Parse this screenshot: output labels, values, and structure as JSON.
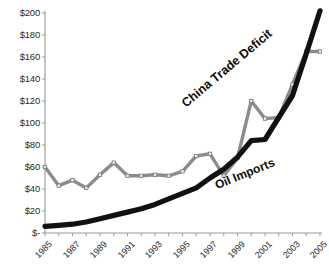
{
  "chart_data": {
    "type": "line",
    "title": "",
    "xlabel": "",
    "ylabel": "",
    "x": [
      1985,
      1986,
      1987,
      1988,
      1989,
      1990,
      1991,
      1992,
      1993,
      1994,
      1995,
      1996,
      1997,
      1998,
      1999,
      2000,
      2001,
      2002,
      2003,
      2004,
      2005
    ],
    "tick_labels": [
      "1985",
      "1987",
      "1989",
      "1991",
      "1993",
      "1995",
      "1997",
      "1999",
      "2001",
      "2003",
      "2005"
    ],
    "y_ticks": [
      "$-",
      "$20",
      "$40",
      "$60",
      "$80",
      "$100",
      "$120",
      "$140",
      "$160",
      "$180",
      "$200"
    ],
    "y_tick_values": [
      0,
      20,
      40,
      60,
      80,
      100,
      120,
      140,
      160,
      180,
      200
    ],
    "ylim": [
      0,
      200
    ],
    "xlim": [
      1985,
      2005
    ],
    "grid": false,
    "legend_position": "inline-rotated",
    "series": [
      {
        "name": "China Trade Deficit",
        "color": "#111111",
        "style": "thick-line-no-markers",
        "values": [
          6,
          7,
          8,
          10,
          13,
          16,
          19,
          22,
          26,
          31,
          36,
          41,
          50,
          58,
          69,
          84,
          85,
          105,
          125,
          163,
          202
        ]
      },
      {
        "name": "Oil Imports",
        "color": "#8c8c8c",
        "style": "line-with-square-markers",
        "values": [
          60,
          43,
          48,
          41,
          53,
          64,
          52,
          52,
          53,
          52,
          56,
          70,
          72,
          52,
          68,
          120,
          104,
          105,
          135,
          165,
          165
        ]
      }
    ],
    "annotations": [
      {
        "text": "China Trade Deficit",
        "rotation": -40
      },
      {
        "text": "Oil Imports",
        "rotation": -22
      }
    ]
  },
  "axis": {
    "y_labels": [
      "$200",
      "$180",
      "$160",
      "$140",
      "$120",
      "$100",
      "$80",
      "$60",
      "$40",
      "$20",
      "$-"
    ],
    "x_labels": [
      "1985",
      "1987",
      "1989",
      "1991",
      "1993",
      "1995",
      "1997",
      "1999",
      "2001",
      "2003",
      "2005"
    ]
  },
  "series_labels": {
    "china": "China Trade Deficit",
    "oil": "Oil Imports"
  },
  "caption": {
    "cut_off_text": ""
  },
  "colors": {
    "china_line": "#111111",
    "oil_line": "#8c8c8c",
    "marker_fill": "#e8e8e8",
    "axis": "#9a9a9a",
    "text": "#2b2b2b",
    "background": "#ffffff"
  }
}
